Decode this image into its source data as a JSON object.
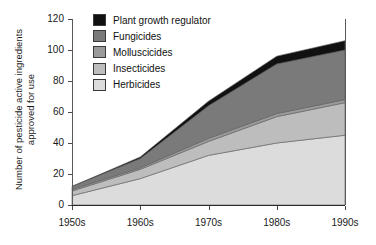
{
  "chart_data": {
    "type": "area",
    "stacked": true,
    "title": "",
    "xlabel": "",
    "ylabel": "Number of pesticide active ingredients\napproved for use",
    "categories": [
      "1950s",
      "1960s",
      "1970s",
      "1980s",
      "1990s"
    ],
    "x_values": [
      1950,
      1960,
      1970,
      1980,
      1990
    ],
    "xlim": [
      1950,
      1990
    ],
    "ylim": [
      0,
      120
    ],
    "yticks": [
      0,
      20,
      40,
      60,
      80,
      100,
      120
    ],
    "ytick_labels": [
      "0",
      "20",
      "40",
      "60",
      "80",
      "100",
      "120"
    ],
    "xtick_labels": [
      "1950s",
      "1960s",
      "1970s",
      "1980s",
      "1990s"
    ],
    "grid": false,
    "legend_position": "top-left-inside",
    "series": [
      {
        "name": "Herbicides",
        "color": "#dcdcdc",
        "values": [
          6,
          17,
          32,
          40,
          45
        ]
      },
      {
        "name": "Insecticides",
        "color": "#bdbdbd",
        "values": [
          3,
          6,
          9,
          17,
          21
        ]
      },
      {
        "name": "Molluscicides",
        "color": "#9a9a9a",
        "values": [
          1,
          1,
          2,
          2,
          2
        ]
      },
      {
        "name": "Fungicides",
        "color": "#7a7a7a",
        "values": [
          2,
          6,
          21,
          32,
          32
        ]
      },
      {
        "name": "Plant growth regulator",
        "color": "#111111",
        "values": [
          0,
          1,
          3,
          5,
          6
        ]
      }
    ],
    "totals": [
      12,
      31,
      67,
      96,
      106
    ]
  },
  "legend": {
    "items": [
      {
        "label": "Plant growth regulator",
        "color": "#111111"
      },
      {
        "label": "Fungicides",
        "color": "#7a7a7a"
      },
      {
        "label": "Molluscicides",
        "color": "#9a9a9a"
      },
      {
        "label": "Insecticides",
        "color": "#bdbdbd"
      },
      {
        "label": "Herbicides",
        "color": "#dcdcdc"
      }
    ]
  }
}
